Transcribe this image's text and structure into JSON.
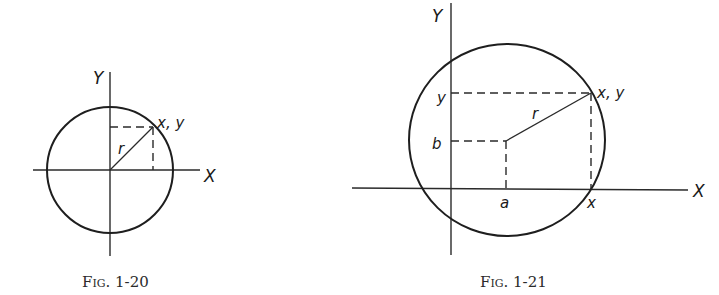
{
  "figures": [
    {
      "id": "fig-1-20",
      "caption": "Fig. 1-20",
      "labels": {
        "y_axis": "Y",
        "x_axis": "X",
        "point": "x, y",
        "radius": "r"
      }
    },
    {
      "id": "fig-1-21",
      "caption": "Fig. 1-21",
      "labels": {
        "y_axis": "Y",
        "x_axis": "X",
        "point": "x, y",
        "radius": "r",
        "y_tick": "y",
        "b_tick": "b",
        "a_tick": "a",
        "x_tick": "x"
      }
    }
  ],
  "colors": {
    "ink": "#1e1e1e",
    "background": "#ffffff"
  }
}
